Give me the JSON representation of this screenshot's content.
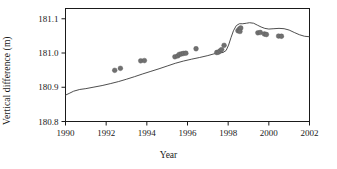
{
  "chart_data": {
    "type": "scatter",
    "title": "",
    "xlabel": "Year",
    "ylabel": "Vertical difference (m)",
    "xlim": [
      1990,
      2002
    ],
    "ylim": [
      180.8,
      181.13
    ],
    "xticks": [
      1990,
      1992,
      1994,
      1996,
      1998,
      2000,
      2002
    ],
    "xtick_labels": [
      "1990",
      "1992",
      "1994",
      "1996",
      "1998",
      "2000",
      "2002"
    ],
    "yticks": [
      180.8,
      180.9,
      181.0,
      181.1
    ],
    "ytick_labels": [
      "180.8",
      "180.9",
      "181.0",
      "181.1"
    ],
    "grid": false,
    "legend": false,
    "marker_color": "#707070",
    "line_color": "#3a3a3a",
    "axis_color": "#1a1a1a",
    "series": [
      {
        "name": "observations",
        "kind": "scatter",
        "marker": "circle",
        "points": [
          [
            1992.42,
            180.9495
          ],
          [
            1992.7,
            180.9553
          ],
          [
            1993.7,
            180.9772
          ],
          [
            1993.88,
            180.978
          ],
          [
            1995.38,
            180.989
          ],
          [
            1995.52,
            180.9915
          ],
          [
            1995.6,
            180.996
          ],
          [
            1995.7,
            180.9972
          ],
          [
            1995.8,
            180.9988
          ],
          [
            1995.92,
            180.9995
          ],
          [
            1996.42,
            181.0125
          ],
          [
            1997.44,
            181.0015
          ],
          [
            1997.52,
            181.0025
          ],
          [
            1997.6,
            181.006
          ],
          [
            1997.68,
            181.01
          ],
          [
            1997.8,
            181.0225
          ],
          [
            1998.48,
            181.065
          ],
          [
            1998.56,
            181.0705
          ],
          [
            1998.62,
            181.073
          ],
          [
            1998.58,
            181.063
          ],
          [
            1999.46,
            181.059
          ],
          [
            1999.58,
            181.06
          ],
          [
            1999.78,
            181.0555
          ],
          [
            1999.88,
            181.054
          ],
          [
            2000.48,
            181.0495
          ],
          [
            2000.62,
            181.049
          ]
        ]
      },
      {
        "name": "model-curve",
        "kind": "line",
        "points": [
          [
            1990.0,
            180.877
          ],
          [
            1990.18,
            180.882
          ],
          [
            1990.4,
            180.8885
          ],
          [
            1990.7,
            180.8935
          ],
          [
            1991.0,
            180.896
          ],
          [
            1991.4,
            180.9005
          ],
          [
            1991.8,
            180.905
          ],
          [
            1992.2,
            180.9105
          ],
          [
            1992.6,
            180.9165
          ],
          [
            1993.0,
            180.9235
          ],
          [
            1993.4,
            180.931
          ],
          [
            1993.8,
            180.939
          ],
          [
            1994.2,
            180.9465
          ],
          [
            1994.6,
            180.954
          ],
          [
            1995.0,
            180.962
          ],
          [
            1995.4,
            180.97
          ],
          [
            1995.8,
            180.9765
          ],
          [
            1996.2,
            180.982
          ],
          [
            1996.6,
            180.987
          ],
          [
            1997.0,
            180.9925
          ],
          [
            1997.3,
            180.9975
          ],
          [
            1997.55,
            181.0005
          ],
          [
            1997.75,
            181.0015
          ],
          [
            1997.9,
            181.0075
          ],
          [
            1998.02,
            181.023
          ],
          [
            1998.14,
            181.045
          ],
          [
            1998.26,
            181.065
          ],
          [
            1998.4,
            181.08
          ],
          [
            1998.55,
            181.0855
          ],
          [
            1998.72,
            181.0855
          ],
          [
            1998.9,
            181.087
          ],
          [
            1999.05,
            181.0885
          ],
          [
            1999.25,
            181.087
          ],
          [
            1999.45,
            181.081
          ],
          [
            1999.62,
            181.076
          ],
          [
            1999.8,
            181.072
          ],
          [
            2000.0,
            181.07
          ],
          [
            2000.25,
            181.071
          ],
          [
            2000.5,
            181.072
          ],
          [
            2000.75,
            181.071
          ],
          [
            2001.0,
            181.067
          ],
          [
            2001.25,
            181.06
          ],
          [
            2001.5,
            181.0535
          ],
          [
            2001.75,
            181.049
          ],
          [
            2002.0,
            181.0475
          ]
        ]
      }
    ]
  },
  "axes": {
    "ylabel_text": "Vertical difference (m)",
    "xlabel_text": "Year"
  }
}
